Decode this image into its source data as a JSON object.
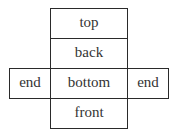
{
  "diagram": {
    "type": "net-of-rectangular-prism",
    "faces": {
      "top": "top",
      "back": "back",
      "left_end": "end",
      "bottom": "bottom",
      "right_end": "end",
      "front": "front"
    },
    "layout": [
      [
        "",
        "top",
        ""
      ],
      [
        "",
        "back",
        ""
      ],
      [
        "end",
        "bottom",
        "end"
      ],
      [
        "",
        "front",
        ""
      ]
    ]
  }
}
